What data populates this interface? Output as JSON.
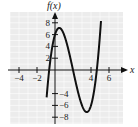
{
  "chart_data": {
    "type": "line",
    "title": "",
    "function": "f(x) = x^3 - 6x^2 + 5x + 6",
    "xlabel": "x",
    "ylabel": "f(x)",
    "xlim": [
      -5,
      7
    ],
    "ylim": [
      -9,
      9
    ],
    "grid": true,
    "x_ticks": [
      -4,
      -2,
      4,
      6
    ],
    "y_ticks": [
      8,
      6,
      4,
      2,
      -4,
      -6,
      -8
    ],
    "x_tick_labels": [
      "−4",
      "−2",
      "4",
      "6"
    ],
    "y_tick_labels": [
      "8",
      "6",
      "4",
      "2",
      "−4",
      "−6",
      "−8"
    ],
    "series": [
      {
        "name": "f(x)",
        "x": [
          -0.9,
          -0.65,
          0,
          0.47,
          1,
          2,
          3,
          3.53,
          4,
          4.65,
          5.1
        ],
        "values": [
          -1.84,
          0,
          6,
          7.1,
          6,
          0,
          -6,
          -7.15,
          -6,
          0,
          5.3
        ]
      }
    ],
    "key_points": {
      "local_max": [
        0.47,
        7.1
      ],
      "local_min": [
        3.53,
        -7.15
      ],
      "roots": [
        -0.65,
        2,
        4.65
      ],
      "y_intercept": 6
    }
  }
}
